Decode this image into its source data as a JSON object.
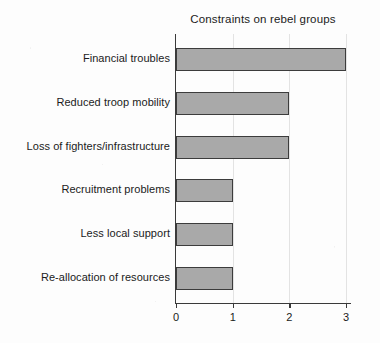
{
  "chart_data": {
    "type": "bar",
    "orientation": "horizontal",
    "title": "Constraints on rebel groups",
    "xlabel": "",
    "ylabel": "",
    "categories": [
      "Financial troubles",
      "Reduced troop mobility",
      "Loss of fighters/infrastructure",
      "Recruitment problems",
      "Less local support",
      "Re-allocation of resources"
    ],
    "values": [
      3,
      2,
      2,
      1,
      1,
      1
    ],
    "xticks": [
      "0",
      "1",
      "2",
      "3"
    ],
    "xtick_values": [
      0,
      1,
      2,
      3
    ],
    "xlim": [
      0,
      3.05
    ],
    "grid": "vertical-faint",
    "legend": null,
    "colors": {
      "bar_fill": "#a9a9a9",
      "bar_border": "#3c3c3c",
      "axis": "#3a3a3a",
      "grid": "#e3e3e3",
      "text": "#1b1b1b",
      "background": "#fdfdfd"
    }
  }
}
